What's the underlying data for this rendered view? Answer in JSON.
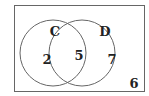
{
  "diagram": {
    "type": "venn",
    "sets": [
      {
        "label": "C",
        "only": "2"
      },
      {
        "label": "D",
        "only": "7"
      }
    ],
    "intersection": "5",
    "outside": "6",
    "colors": {
      "stroke": "#555555",
      "text": "#222222",
      "background": "#ffffff"
    }
  }
}
